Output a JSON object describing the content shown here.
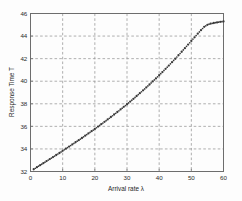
{
  "chart_data": {
    "type": "scatter",
    "title": "",
    "xlabel": "Arrival rate λ",
    "ylabel": "Response Time T",
    "xlim": [
      0,
      60
    ],
    "ylim": [
      32,
      46
    ],
    "xticks": [
      0,
      10,
      20,
      30,
      40,
      50,
      60
    ],
    "yticks": [
      32,
      34,
      36,
      38,
      40,
      42,
      44,
      46
    ],
    "xtick_labels": [
      "0",
      "10",
      "20",
      "30",
      "40",
      "50",
      "60"
    ],
    "ytick_labels": [
      "32",
      "34",
      "36",
      "38",
      "40",
      "42",
      "44",
      "46"
    ],
    "grid": true,
    "legend": null,
    "marker": "dot",
    "marker_color": "#3a3a3a",
    "series": [
      {
        "name": "Response Time T",
        "x": [
          1,
          2,
          3,
          4,
          5,
          6,
          7,
          8,
          9,
          10,
          11,
          12,
          13,
          14,
          15,
          16,
          17,
          18,
          19,
          20,
          21,
          22,
          23,
          24,
          25,
          26,
          27,
          28,
          29,
          30,
          31,
          32,
          33,
          34,
          35,
          36,
          37,
          38,
          39,
          40,
          41,
          42,
          43,
          44,
          45,
          46,
          47,
          48,
          49,
          50,
          51,
          52,
          53,
          54,
          55,
          56,
          57,
          58,
          59,
          60
        ],
        "y": [
          32.2,
          32.38,
          32.56,
          32.74,
          32.92,
          33.1,
          33.28,
          33.46,
          33.64,
          33.83,
          34.02,
          34.21,
          34.4,
          34.59,
          34.78,
          34.97,
          35.17,
          35.37,
          35.57,
          35.77,
          35.98,
          36.19,
          36.4,
          36.61,
          36.83,
          37.05,
          37.27,
          37.5,
          37.73,
          37.96,
          38.2,
          38.44,
          38.69,
          38.94,
          39.19,
          39.45,
          39.71,
          39.98,
          40.25,
          40.53,
          40.81,
          41.1,
          41.39,
          41.69,
          41.99,
          42.3,
          42.61,
          42.93,
          43.25,
          43.57,
          43.89,
          44.21,
          44.52,
          44.82,
          45.0,
          45.1,
          45.16,
          45.21,
          45.26,
          45.3
        ]
      }
    ]
  }
}
